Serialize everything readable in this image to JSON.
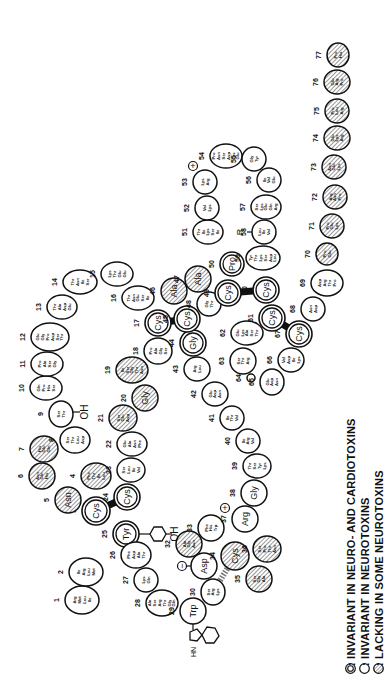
{
  "colors": {
    "ink": "#111111",
    "background": "#ffffff",
    "hatch": "#555555"
  },
  "legend": {
    "items": [
      {
        "symbol": "double-circle",
        "label": ": INVARIANT  IN NEURO- AND  CARDIOTOXINS"
      },
      {
        "symbol": "single-circle",
        "label": ": INVARIANT  IN NEUROTOXINS"
      },
      {
        "symbol": "hatched-circle",
        "label": ": LACKING IN SOME NEUROTOXINS"
      }
    ]
  },
  "residues": [
    {
      "n": "1",
      "label": "Arg Met Leu Ile",
      "type": "single",
      "x": 82,
      "y": 600,
      "rx": 17,
      "ry": 14
    },
    {
      "n": "2",
      "label": "Ile Arg Leu Met",
      "type": "single",
      "x": 86,
      "y": 572,
      "rx": 17,
      "ry": 14
    },
    {
      "n": "3",
      "label": "Cys",
      "type": "double",
      "x": 96,
      "y": 511,
      "rx": 14,
      "ry": 14
    },
    {
      "n": "4",
      "label": "Phe Thr Ile Leu",
      "type": "hatched",
      "x": 96,
      "y": 476,
      "rx": 15,
      "ry": 13
    },
    {
      "n": "5",
      "label": "Asn",
      "type": "hatched",
      "x": 68,
      "y": 500,
      "rx": 13,
      "ry": 13
    },
    {
      "n": "6",
      "label": "Asn Gln His",
      "type": "hatched",
      "x": 42,
      "y": 476,
      "rx": 13,
      "ry": 13
    },
    {
      "n": "7",
      "label": "His Glu Gln",
      "type": "hatched",
      "x": 44,
      "y": 449,
      "rx": 14,
      "ry": 13
    },
    {
      "n": "8",
      "label": "Ser Thr Leu Asp",
      "type": "single",
      "x": 75,
      "y": 440,
      "rx": 15,
      "ry": 13
    },
    {
      "n": "9",
      "label": "Ser Thr",
      "type": "single",
      "x": 61,
      "y": 414,
      "rx": 12,
      "ry": 13
    },
    {
      "n": "10",
      "label": "Gln Pro His Ser",
      "type": "single",
      "x": 46,
      "y": 388,
      "rx": 16,
      "ry": 12
    },
    {
      "n": "11",
      "label": "Pro Ala Ser Gly",
      "type": "single",
      "x": 47,
      "y": 364,
      "rx": 16,
      "ry": 12
    },
    {
      "n": "12",
      "label": "Glu Gly Pro Asp Ser Thr",
      "type": "single",
      "x": 50,
      "y": 337,
      "rx": 19,
      "ry": 14
    },
    {
      "n": "13",
      "label": "Thr Ala Asp Glu",
      "type": "single",
      "x": 62,
      "y": 307,
      "rx": 15,
      "ry": 12
    },
    {
      "n": "14",
      "label": "Thr Asn Ile Ser",
      "type": "single",
      "x": 80,
      "y": 282,
      "rx": 17,
      "ry": 12
    },
    {
      "n": "15",
      "label": "Lys Thr Glu Glu",
      "type": "single",
      "x": 117,
      "y": 274,
      "rx": 16,
      "ry": 12
    },
    {
      "n": "16",
      "label": "Thr Asn Glu Ser Ile",
      "type": "single",
      "x": 138,
      "y": 298,
      "rx": 16,
      "ry": 12
    },
    {
      "n": "17",
      "label": "Cys",
      "type": "double",
      "x": 158,
      "y": 323,
      "rx": 13,
      "ry": 13
    },
    {
      "n": "18",
      "label": "Pro Ala Gly Ser",
      "type": "single",
      "x": 158,
      "y": 351,
      "rx": 14,
      "ry": 13
    },
    {
      "n": "19",
      "label": "Ile Ser Gly Thr Asn",
      "type": "hatched",
      "x": 132,
      "y": 370,
      "rx": 16,
      "ry": 13
    },
    {
      "n": "20",
      "label": "Gly",
      "type": "hatched",
      "x": 145,
      "y": 398,
      "rx": 13,
      "ry": 13
    },
    {
      "n": "21",
      "label": "Ser Glu Asp",
      "type": "hatched",
      "x": 123,
      "y": 418,
      "rx": 14,
      "ry": 13
    },
    {
      "n": "22",
      "label": "Glu Ala Asn Phe",
      "type": "single",
      "x": 132,
      "y": 444,
      "rx": 15,
      "ry": 12
    },
    {
      "n": "23",
      "label": "Ser Leu Ile Val",
      "type": "single",
      "x": 131,
      "y": 470,
      "rx": 14,
      "ry": 12
    },
    {
      "n": "24",
      "label": "Cys",
      "type": "double",
      "x": 127,
      "y": 497,
      "rx": 13,
      "ry": 13
    },
    {
      "n": "25",
      "label": "Tyr",
      "type": "double",
      "x": 126,
      "y": 534,
      "rx": 13,
      "ry": 13
    },
    {
      "n": "26",
      "label": "Phe Asp Ala Thr",
      "type": "single",
      "x": 136,
      "y": 555,
      "rx": 15,
      "ry": 13
    },
    {
      "n": "27",
      "label": "Lys Gln",
      "type": "single",
      "x": 146,
      "y": 580,
      "rx": 12,
      "ry": 12
    },
    {
      "n": "28",
      "label": "Ala Ser Arg Thr Gly Gln",
      "type": "single",
      "x": 162,
      "y": 603,
      "rx": 16,
      "ry": 13
    },
    {
      "n": "29",
      "label": "Trp",
      "type": "single",
      "x": 193,
      "y": 611,
      "rx": 13,
      "ry": 13
    },
    {
      "n": "30",
      "label": "Ser Arg Lys",
      "type": "single",
      "x": 213,
      "y": 592,
      "rx": 12,
      "ry": 13
    },
    {
      "n": "31",
      "label": "Asp",
      "type": "single",
      "x": 204,
      "y": 566,
      "rx": 13,
      "ry": 13
    },
    {
      "n": "32",
      "label": "Ala Gly Asn",
      "type": "hatched",
      "x": 189,
      "y": 544,
      "rx": 13,
      "ry": 13
    },
    {
      "n": "33",
      "label": "Phe His Trp",
      "type": "single",
      "x": 211,
      "y": 528,
      "rx": 13,
      "ry": 13
    },
    {
      "n": "34",
      "label": "Cys",
      "type": "hatched",
      "x": 235,
      "y": 556,
      "rx": 14,
      "ry": 14
    },
    {
      "n": "35",
      "label": "Ser Gly Ala",
      "type": "hatched",
      "x": 259,
      "y": 579,
      "rx": 13,
      "ry": 13
    },
    {
      "n": "36",
      "label": "Ser Pro Thr Asn",
      "type": "hatched",
      "x": 267,
      "y": 549,
      "rx": 14,
      "ry": 13
    },
    {
      "n": "37",
      "label": "Arg",
      "type": "single",
      "x": 245,
      "y": 519,
      "rx": 13,
      "ry": 13
    },
    {
      "n": "38",
      "label": "Gly",
      "type": "single",
      "x": 254,
      "y": 493,
      "rx": 13,
      "ry": 13
    },
    {
      "n": "39",
      "label": "Thr Ser Tyr Lys",
      "type": "single",
      "x": 257,
      "y": 466,
      "rx": 14,
      "ry": 12
    },
    {
      "n": "40",
      "label": "Ile Arg Val",
      "type": "single",
      "x": 248,
      "y": 441,
      "rx": 12,
      "ry": 12
    },
    {
      "n": "41",
      "label": "Ile Thr Val",
      "type": "single",
      "x": 232,
      "y": 418,
      "rx": 12,
      "ry": 12
    },
    {
      "n": "42",
      "label": "Glu Asp Asn",
      "type": "single",
      "x": 215,
      "y": 394,
      "rx": 13,
      "ry": 12
    },
    {
      "n": "43",
      "label": "Arg Leu",
      "type": "single",
      "x": 197,
      "y": 369,
      "rx": 13,
      "ry": 12
    },
    {
      "n": "44",
      "label": "Gly",
      "type": "double",
      "x": 193,
      "y": 343,
      "rx": 13,
      "ry": 13
    },
    {
      "n": "45",
      "label": "Cys",
      "type": "double",
      "x": 187,
      "y": 319,
      "rx": 13,
      "ry": 13
    },
    {
      "n": "46",
      "label": "Ala",
      "type": "hatched",
      "x": 174,
      "y": 291,
      "rx": 13,
      "ry": 13
    },
    {
      "n": "47",
      "label": "Ala",
      "type": "hatched",
      "x": 198,
      "y": 279,
      "rx": 13,
      "ry": 13
    },
    {
      "n": "48",
      "label": "Gly Thr",
      "type": "single",
      "x": 209,
      "y": 304,
      "rx": 12,
      "ry": 12
    },
    {
      "n": "49",
      "label": "Cys",
      "type": "double",
      "x": 228,
      "y": 293,
      "rx": 13,
      "ry": 13
    },
    {
      "n": "50",
      "label": "Pro",
      "type": "double",
      "x": 232,
      "y": 264,
      "rx": 12,
      "ry": 12
    },
    {
      "n": "51",
      "label": "Thr Ile Lys Ser Ile",
      "type": "single",
      "x": 208,
      "y": 232,
      "rx": 15,
      "ry": 12
    },
    {
      "n": "52",
      "label": "Val Lys",
      "type": "single",
      "x": 207,
      "y": 208,
      "rx": 12,
      "ry": 12
    },
    {
      "n": "53",
      "label": "Lys Arg",
      "type": "single",
      "x": 205,
      "y": 182,
      "rx": 12,
      "ry": 12
    },
    {
      "n": "54",
      "label": "Pro Asn Ser Asp Lys Glu",
      "type": "single",
      "x": 226,
      "y": 156,
      "rx": 16,
      "ry": 12
    },
    {
      "n": "55",
      "label": "Gly Tyr",
      "type": "single",
      "x": 254,
      "y": 159,
      "rx": 12,
      "ry": 12
    },
    {
      "n": "56",
      "label": "Ile Val Glu",
      "type": "single",
      "x": 269,
      "y": 180,
      "rx": 12,
      "ry": 12
    },
    {
      "n": "57",
      "label": "Ser Lys Glu Gln Arg",
      "type": "single",
      "x": 266,
      "y": 207,
      "rx": 15,
      "ry": 12
    },
    {
      "n": "58",
      "label": "Leu Ile Val",
      "type": "single",
      "x": 264,
      "y": 232,
      "rx": 12,
      "ry": 12
    },
    {
      "n": "59",
      "label": "Tyr Thr Lys Ser Asp Leu",
      "type": "single",
      "x": 263,
      "y": 258,
      "rx": 17,
      "ry": 12
    },
    {
      "n": "60",
      "label": "Cys",
      "type": "double",
      "x": 266,
      "y": 290,
      "rx": 13,
      "ry": 13
    },
    {
      "n": "61",
      "label": "Cys",
      "type": "double",
      "x": 272,
      "y": 318,
      "rx": 13,
      "ry": 13
    },
    {
      "n": "62",
      "label": "Glu Lys Ala Ser Thr",
      "type": "single",
      "x": 247,
      "y": 333,
      "rx": 16,
      "ry": 12
    },
    {
      "n": "63",
      "label": "Ser Thr Arg",
      "type": "single",
      "x": 243,
      "y": 361,
      "rx": 13,
      "ry": 13
    },
    {
      "n": "64",
      "label": "",
      "type": "single",
      "x": 251,
      "y": 378,
      "rx": 4,
      "ry": 4
    },
    {
      "n": "65",
      "label": "Glu Asp Asn",
      "type": "single",
      "x": 272,
      "y": 382,
      "rx": 12,
      "ry": 13
    },
    {
      "n": "66",
      "label": "Val Asp Ile Lys",
      "type": "single",
      "x": 291,
      "y": 360,
      "rx": 13,
      "ry": 12
    },
    {
      "n": "67",
      "label": "Cys",
      "type": "double",
      "x": 299,
      "y": 334,
      "rx": 13,
      "ry": 13
    },
    {
      "n": "68",
      "label": "Asn Asp",
      "type": "single",
      "x": 313,
      "y": 309,
      "rx": 12,
      "ry": 12
    },
    {
      "n": "69",
      "label": "Asp Arg Thr Pro",
      "type": "single",
      "x": 327,
      "y": 283,
      "rx": 16,
      "ry": 13
    },
    {
      "n": "70",
      "label": "Pro Glu",
      "type": "hatched",
      "x": 327,
      "y": 254,
      "rx": 11,
      "ry": 11
    },
    {
      "n": "71",
      "label": "Pro Glu Lys",
      "type": "hatched",
      "x": 332,
      "y": 226,
      "rx": 12,
      "ry": 12
    },
    {
      "n": "72",
      "label": "Arg Asn Pro",
      "type": "hatched",
      "x": 335,
      "y": 197,
      "rx": 12,
      "ry": 12
    },
    {
      "n": "73",
      "label": "Asn Glu Lys",
      "type": "hatched",
      "x": 334,
      "y": 167,
      "rx": 12,
      "ry": 12
    },
    {
      "n": "74",
      "label": "Glu Lys Arg",
      "type": "hatched",
      "x": 337,
      "y": 138,
      "rx": 13,
      "ry": 12
    },
    {
      "n": "75",
      "label": "Pro Leu Arg",
      "type": "hatched",
      "x": 337,
      "y": 111,
      "rx": 12,
      "ry": 12
    },
    {
      "n": "76",
      "label": "Glu Arg Pro",
      "type": "hatched",
      "x": 337,
      "y": 82,
      "rx": 13,
      "ry": 12
    },
    {
      "n": "77",
      "label": "Pro His",
      "type": "hatched",
      "x": 338,
      "y": 55,
      "rx": 11,
      "ry": 12
    }
  ],
  "annotations": {
    "oh_ser9": "OH",
    "oh_tyr25": "OH",
    "plus_53": "+",
    "plus_37": "+",
    "minus_31": "−",
    "r_58": "R",
    "nh_trp": "HN"
  },
  "disulfides": [
    {
      "from": "3",
      "to": "24"
    },
    {
      "from": "17",
      "to": "45"
    },
    {
      "from": "49",
      "to": "60"
    },
    {
      "from": "61",
      "to": "67"
    },
    {
      "from": "34",
      "to": "30"
    }
  ]
}
